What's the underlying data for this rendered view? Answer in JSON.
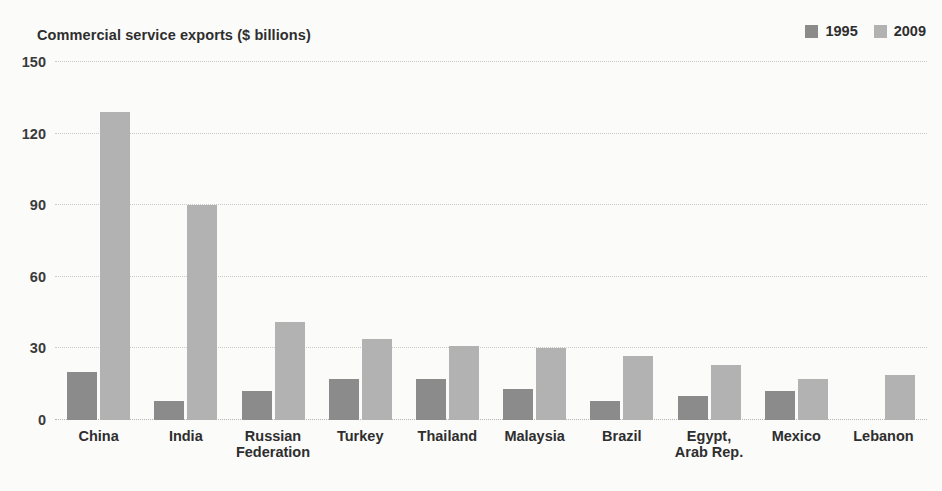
{
  "chart_data": {
    "type": "bar",
    "title": "Commercial service exports ($ billions)",
    "xlabel": "",
    "ylabel": "",
    "ylim": [
      0,
      150
    ],
    "yticks": [
      0,
      30,
      60,
      90,
      120,
      150
    ],
    "ytick_labels": [
      "0",
      "30",
      "60",
      "90",
      "120",
      "150"
    ],
    "grid": true,
    "legend_position": "top-right",
    "categories": [
      "China",
      "India",
      "Russian\nFederation",
      "Turkey",
      "Thailand",
      "Malaysia",
      "Brazil",
      "Egypt,\nArab Rep.",
      "Mexico",
      "Lebanon"
    ],
    "series": [
      {
        "name": "1995",
        "color": "#8b8b8b",
        "values": [
          20,
          8,
          12,
          17,
          17,
          13,
          8,
          10,
          12,
          null
        ]
      },
      {
        "name": "2009",
        "color": "#b2b2b2",
        "values": [
          129,
          90,
          41,
          34,
          31,
          30,
          27,
          23,
          17,
          19
        ]
      }
    ]
  },
  "colors": {
    "series_1995": "#8b8b8b",
    "series_2009": "#b2b2b2",
    "gridline": "#c9c9c9",
    "text": "#2e2e2e",
    "background": "#fbfbfa"
  }
}
